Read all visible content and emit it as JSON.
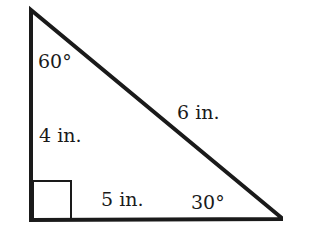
{
  "diagram": {
    "type": "right-triangle",
    "stroke_color": "#1a1a1a",
    "vertices": {
      "top": [
        31,
        10
      ],
      "bottom_left": [
        31,
        220
      ],
      "bottom_right": [
        283,
        219
      ]
    },
    "labels": {
      "top_angle": "60°",
      "left_side": "4 in.",
      "hypotenuse": "6 in.",
      "bottom_side": "5 in.",
      "bottom_right_angle": "30°"
    },
    "right_angle_marker": true
  }
}
